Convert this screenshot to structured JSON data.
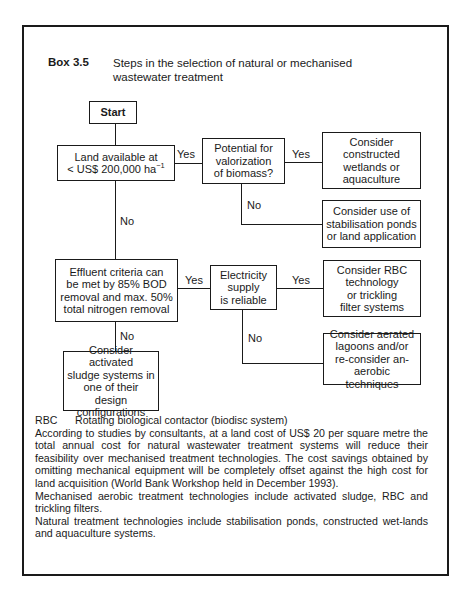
{
  "box": {
    "label": "Box 3.5",
    "title": "Steps in the selection of natural or mechanised wastewater treatment"
  },
  "flowchart": {
    "nodes": {
      "start": "Start",
      "land": "Land available at\n< US$ 200,000 ha",
      "land_sup": "−1",
      "potential": "Potential for\nvalorization\nof biomass?",
      "wetlands": "Consider\nconstructed\nwetlands or\naquaculture",
      "ponds": "Consider use of\nstabilisation ponds\nor land application",
      "effluent": "Effluent criteria can\nbe met by 85% BOD\nremoval and max. 50%\ntotal nitrogen removal",
      "electricity": "Electricity\nsupply\nis reliable",
      "rbc": "Consider RBC\ntechnology\nor trickling\nfilter systems",
      "aerated": "Consider aerated\nlagoons and/or\nre-consider an-\naerobic techniques",
      "sludge": "Consider activated\nsludge systems in\none of their design\nconfigurations"
    },
    "edges": {
      "land_yes": "Yes",
      "land_no": "No",
      "potential_yes": "Yes",
      "potential_no": "No",
      "effluent_yes": "Yes",
      "effluent_no": "No",
      "electricity_yes": "Yes",
      "electricity_no": "No"
    }
  },
  "notes": {
    "abbreviation": {
      "term": "RBC",
      "definition": "Rotating biological contactor (biodisc system)"
    },
    "paragraphs": [
      "According to studies by consultants, at a land cost of US$ 20 per square metre the total annual cost for natural wastewater treatment systems will reduce their feasibility over mechanised treatment technologies. The cost savings obtained by omitting mechanical equipment will be completely offset against the high cost for land acquisition (World Bank Workshop held in December 1993).",
      "Mechanised aerobic treatment technologies include activated sludge, RBC and trickling filters.",
      "Natural treatment technologies include stabilisation ponds, constructed wet-lands and aquaculture systems."
    ]
  }
}
